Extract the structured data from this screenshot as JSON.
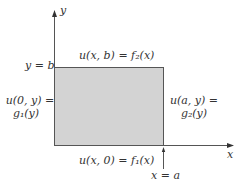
{
  "diagram": {
    "type": "boundary-value-rectangle",
    "axes": {
      "x_label": "x",
      "y_label": "y"
    },
    "region": {
      "fill": "#d3d3d3",
      "stroke": "#555555"
    },
    "labels": {
      "y_equals_b": "y = b",
      "x_equals_a": "x = a",
      "top_boundary": "u(x, b) = f₂(x)",
      "bottom_boundary": "u(x, 0) = f₁(x)",
      "left_boundary_line1": "u(0, y) =",
      "left_boundary_line2": "g₁(y)",
      "right_boundary_line1": "u(a, y) =",
      "right_boundary_line2": "g₂(y)"
    }
  }
}
